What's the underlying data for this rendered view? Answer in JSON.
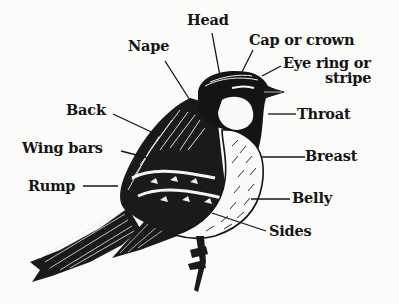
{
  "diagram": {
    "background_color": "#fbfbfa",
    "ink_color": "#141414",
    "labels": {
      "head": "Head",
      "nape": "Nape",
      "cap": "Cap or crown",
      "eye_line1": "Eye ring or",
      "eye_line2": "stripe",
      "back": "Back",
      "throat": "Throat",
      "wing_bars": "Wing bars",
      "breast": "Breast",
      "rump": "Rump",
      "belly": "Belly",
      "sides": "Sides"
    }
  }
}
